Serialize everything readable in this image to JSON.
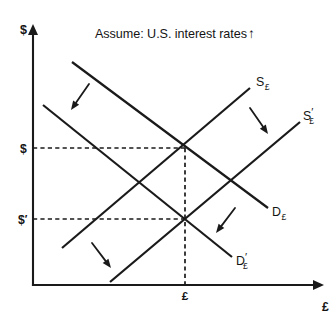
{
  "figure": {
    "title": "Assume: U.S. interest rates",
    "title_arrow": "↑",
    "title_x": 95,
    "title_y": 38
  },
  "axes": {
    "origin_x": 33,
    "origin_y": 285,
    "y_top": 26,
    "x_right": 322,
    "y_axis_label": "$",
    "y_axis_label_x": 20,
    "y_axis_label_y": 34,
    "x_axis_label": "£",
    "x_axis_label_x": 322,
    "x_axis_label_y": 311
  },
  "price_ticks": [
    {
      "name": "price-initial",
      "label": "$",
      "prime": "",
      "x": 20,
      "y": 153,
      "line_y": 148
    },
    {
      "name": "price-new",
      "label": "$",
      "prime": "′",
      "x": 18,
      "y": 224,
      "line_y": 219
    }
  ],
  "quantity_ticks": [
    {
      "name": "quantity-equilibrium",
      "label": "£",
      "x": 185,
      "y": 300,
      "line_x": 185
    }
  ],
  "equilibria": [
    {
      "name": "equilibrium-initial",
      "x": 185,
      "y": 148
    },
    {
      "name": "equilibrium-new",
      "x": 185,
      "y": 219
    }
  ],
  "curves": [
    {
      "name": "supply-curve-initial",
      "id": "S",
      "subscript": "£",
      "prime": "",
      "x1": 62,
      "y1": 248,
      "x2": 250,
      "y2": 88,
      "label_x": 256,
      "label_y": 86
    },
    {
      "name": "supply-curve-shifted",
      "id": "S",
      "subscript": "£",
      "prime": "′",
      "x1": 110,
      "y1": 282,
      "x2": 300,
      "y2": 122,
      "label_x": 303,
      "label_y": 120
    },
    {
      "name": "demand-curve-initial",
      "id": "D",
      "subscript": "£",
      "prime": "",
      "x1": 72,
      "y1": 62,
      "x2": 268,
      "y2": 208,
      "label_x": 272,
      "label_y": 216
    },
    {
      "name": "demand-curve-shifted",
      "id": "D",
      "subscript": "£",
      "prime": "′",
      "x1": 43,
      "y1": 105,
      "x2": 232,
      "y2": 257,
      "label_x": 236,
      "label_y": 265
    }
  ],
  "shift_arrows": [
    {
      "name": "demand-shift-arrow-upper-left",
      "x1": 89,
      "y1": 84,
      "x2": 71,
      "y2": 110
    },
    {
      "name": "supply-shift-arrow-upper-right",
      "x1": 250,
      "y1": 108,
      "x2": 268,
      "y2": 134
    },
    {
      "name": "supply-shift-arrow-lower-left",
      "x1": 92,
      "y1": 243,
      "x2": 111,
      "y2": 268
    },
    {
      "name": "demand-shift-arrow-lower-right",
      "x1": 235,
      "y1": 208,
      "x2": 216,
      "y2": 233
    }
  ],
  "colors": {
    "ink": "#1a1a1a",
    "background": "#ffffff"
  }
}
